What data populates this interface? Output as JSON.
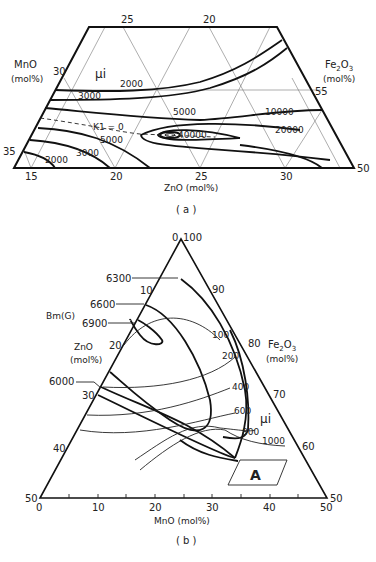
{
  "panel_a": {
    "caption": "( a )",
    "left_axis": {
      "label": "MnO",
      "unit": "(mol%)",
      "ticks": [
        "30",
        "35"
      ]
    },
    "right_axis": {
      "label_main": "Fe",
      "label_sub1": "2",
      "label_mid": "O",
      "label_sub2": "3",
      "unit": "(mol%)",
      "ticks": [
        "55",
        "50"
      ]
    },
    "top_ticks": [
      "25",
      "20"
    ],
    "bottom_axis": {
      "label": "ZnO (mol%)",
      "ticks": [
        "15",
        "20",
        "25",
        "30"
      ]
    },
    "property_label": "μi",
    "k1_label": "K1 = 0",
    "contour_labels": [
      "2000",
      "3000",
      "5000",
      "10000",
      "20000",
      "40000",
      "5000",
      "3000",
      "2000"
    ]
  },
  "panel_b": {
    "caption": "( b )",
    "left_axis": {
      "label": "ZnO",
      "unit": "(mol%)",
      "ticks": [
        "0",
        "10",
        "20",
        "30",
        "40",
        "50"
      ]
    },
    "right_axis": {
      "label_main": "Fe",
      "label_sub1": "2",
      "label_mid": "O",
      "label_sub2": "3",
      "unit": "(mol%)",
      "ticks": [
        "100",
        "90",
        "80",
        "70",
        "60",
        "50"
      ]
    },
    "bottom_axis": {
      "label": "MnO (mol%)",
      "ticks": [
        "0",
        "10",
        "20",
        "30",
        "40",
        "50"
      ]
    },
    "bm_label": "Bm(G)",
    "bm_contours": [
      "6300",
      "6600",
      "6900",
      "6000"
    ],
    "mu_label": "μi",
    "mu_contours": [
      "100",
      "200",
      "400",
      "600",
      "800",
      "1000"
    ],
    "region_label": "A"
  }
}
